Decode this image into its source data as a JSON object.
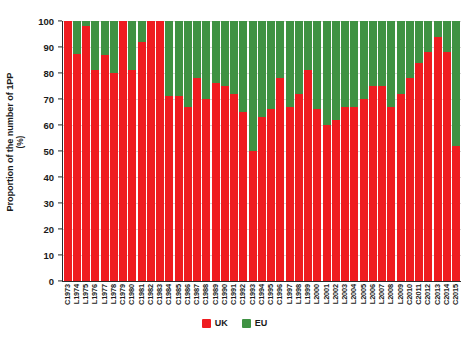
{
  "chart_data": {
    "type": "bar",
    "stacked": true,
    "title": "",
    "xlabel": "",
    "ylabel": "Proportion of the number of 1PP",
    "ylabel_unit": "(%)",
    "ylim": [
      0,
      100
    ],
    "ytick_values": [
      0,
      10,
      20,
      30,
      40,
      50,
      60,
      70,
      80,
      90,
      100
    ],
    "ytick_labels": [
      "0",
      "10",
      "20",
      "30",
      "40",
      "50",
      "60",
      "70",
      "80",
      "90",
      "100"
    ],
    "grid": true,
    "grid_axis": "y",
    "legend_position": "bottom-center",
    "colors": {
      "UK": "#ef1c20",
      "EU": "#3f9243",
      "axis": "#2b2b2b",
      "grid": "#d8d8d8"
    },
    "categories": [
      "C1973",
      "L1974",
      "L1975",
      "L1976",
      "L1977",
      "L1978",
      "C1979",
      "C1980",
      "C1981",
      "C1982",
      "C1983",
      "C1984",
      "C1985",
      "C1986",
      "C1987",
      "C1988",
      "C1989",
      "C1990",
      "C1991",
      "C1992",
      "C1993",
      "C1994",
      "C1995",
      "C1996",
      "L1997",
      "L1998",
      "L1999",
      "L2000",
      "L2001",
      "L2002",
      "L2003",
      "L2004",
      "L2005",
      "L2006",
      "L2007",
      "L2008",
      "L2009",
      "C2010",
      "C2011",
      "C2012",
      "C2013",
      "C2014",
      "C2015"
    ],
    "series": [
      {
        "name": "UK",
        "color": "#ef1c20",
        "values": [
          100,
          87.5,
          98,
          81,
          87,
          80,
          100,
          81,
          92,
          100,
          100,
          71,
          71,
          67,
          78,
          70,
          76,
          75,
          72,
          65,
          50,
          63,
          66,
          78,
          67,
          72,
          81,
          66,
          60,
          62,
          67,
          67,
          70,
          75,
          75,
          67,
          72,
          78,
          84,
          88,
          94,
          88,
          52
        ]
      },
      {
        "name": "EU",
        "color": "#3f9243",
        "values": [
          0,
          12.5,
          2,
          19,
          13,
          20,
          0,
          19,
          8,
          0,
          0,
          29,
          29,
          33,
          22,
          30,
          24,
          25,
          28,
          35,
          50,
          37,
          34,
          22,
          33,
          28,
          19,
          34,
          40,
          38,
          33,
          33,
          30,
          25,
          25,
          33,
          28,
          22,
          16,
          12,
          6,
          12,
          48
        ]
      }
    ]
  },
  "legend": {
    "items": [
      {
        "label": "UK",
        "color": "#ef1c20"
      },
      {
        "label": "EU",
        "color": "#3f9243"
      }
    ]
  }
}
